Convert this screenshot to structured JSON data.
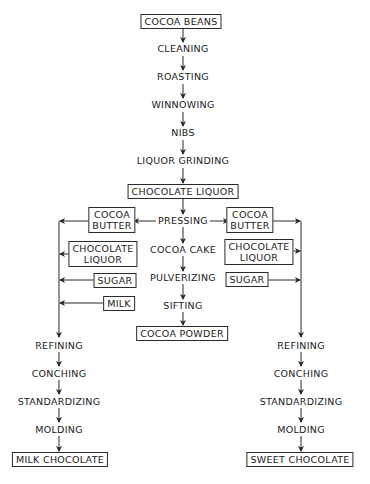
{
  "diagram": {
    "main_flow": [
      {
        "id": "cocoa_beans",
        "label": "COCOA BEANS",
        "boxed": true
      },
      {
        "id": "cleaning",
        "label": "CLEANING",
        "boxed": false
      },
      {
        "id": "roasting",
        "label": "ROASTING",
        "boxed": false
      },
      {
        "id": "winnowing",
        "label": "WINNOWING",
        "boxed": false
      },
      {
        "id": "nibs",
        "label": "NIBS",
        "boxed": false
      },
      {
        "id": "liquor_grinding",
        "label": "LIQUOR GRINDING",
        "boxed": false
      },
      {
        "id": "chocolate_liquor",
        "label": "CHOCOLATE LIQUOR",
        "boxed": true
      },
      {
        "id": "pressing",
        "label": "PRESSING",
        "boxed": false
      },
      {
        "id": "cocoa_cake",
        "label": "COCOA CAKE",
        "boxed": false
      },
      {
        "id": "pulverizing",
        "label": "PULVERIZING",
        "boxed": false
      },
      {
        "id": "sifting",
        "label": "SIFTING",
        "boxed": false
      },
      {
        "id": "cocoa_powder",
        "label": "COCOA POWDER",
        "boxed": true
      }
    ],
    "left_inputs": [
      {
        "id": "l_cocoa_butter",
        "line1": "COCOA",
        "line2": "BUTTER"
      },
      {
        "id": "l_choc_liquor",
        "line1": "CHOCOLATE",
        "line2": "LIQUOR"
      },
      {
        "id": "l_sugar",
        "label": "SUGAR"
      },
      {
        "id": "l_milk",
        "label": "MILK"
      }
    ],
    "right_inputs": [
      {
        "id": "r_cocoa_butter",
        "line1": "COCOA",
        "line2": "BUTTER"
      },
      {
        "id": "r_choc_liquor",
        "line1": "CHOCOLATE",
        "line2": "LIQUOR"
      },
      {
        "id": "r_sugar",
        "label": "SUGAR"
      }
    ],
    "left_flow": [
      {
        "id": "l_refining",
        "label": "REFINING"
      },
      {
        "id": "l_conching",
        "label": "CONCHING"
      },
      {
        "id": "l_standardizing",
        "label": "STANDARDIZING"
      },
      {
        "id": "l_molding",
        "label": "MOLDING"
      },
      {
        "id": "milk_chocolate",
        "label": "MILK CHOCOLATE",
        "boxed": true
      }
    ],
    "right_flow": [
      {
        "id": "r_refining",
        "label": "REFINING"
      },
      {
        "id": "r_conching",
        "label": "CONCHING"
      },
      {
        "id": "r_standardizing",
        "label": "STANDARDIZING"
      },
      {
        "id": "r_molding",
        "label": "MOLDING"
      },
      {
        "id": "sweet_chocolate",
        "label": "SWEET CHOCOLATE",
        "boxed": true
      }
    ],
    "colors": {
      "line": "#2a2a2a",
      "text": "#1a1a1a",
      "background": "#ffffff"
    }
  }
}
